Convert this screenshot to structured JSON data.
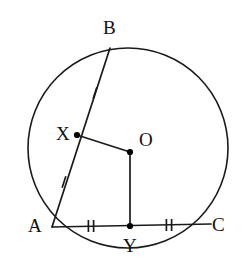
{
  "figure": {
    "type": "circle-geometry-diagram",
    "canvas": {
      "width": 247,
      "height": 263
    },
    "background_color": "#ffffff",
    "stroke_color": "#1a1a1a",
    "point_fill_color": "#000000"
  },
  "circle": {
    "label": "circle",
    "center_x": 128,
    "center_y": 148,
    "radius": 100,
    "stroke_width": 1.6
  },
  "points": [
    {
      "id": "B",
      "label": "B",
      "x": 110,
      "y": 48,
      "on_circle": true,
      "dot": false,
      "label_x": 103,
      "label_y": 18
    },
    {
      "id": "X",
      "label": "X",
      "x": 77,
      "y": 135,
      "on_circle": false,
      "dot": true,
      "label_x": 56,
      "label_y": 124
    },
    {
      "id": "O",
      "label": "O",
      "x": 130,
      "y": 152,
      "on_circle": false,
      "dot": true,
      "label_x": 139,
      "label_y": 130
    },
    {
      "id": "A",
      "label": "A",
      "x": 52,
      "y": 227,
      "on_circle": true,
      "dot": false,
      "label_x": 28,
      "label_y": 216
    },
    {
      "id": "Y",
      "label": "Y",
      "x": 130,
      "y": 226,
      "on_circle": false,
      "dot": true,
      "label_x": 123,
      "label_y": 236
    },
    {
      "id": "C",
      "label": "C",
      "x": 211,
      "y": 224,
      "on_circle": true,
      "dot": false,
      "label_x": 212,
      "label_y": 215
    }
  ],
  "segments": [
    {
      "id": "AB",
      "from": "A",
      "to": "B",
      "x1": 52,
      "y1": 227,
      "x2": 110,
      "y2": 48,
      "description": "chord-a-b"
    },
    {
      "id": "AC",
      "from": "A",
      "to": "C",
      "x1": 52,
      "y1": 227,
      "x2": 211,
      "y2": 224,
      "description": "chord-a-c"
    },
    {
      "id": "OX",
      "from": "O",
      "to": "X",
      "x1": 130,
      "y1": 152,
      "x2": 77,
      "y2": 135,
      "description": "radius-segment-o-x"
    },
    {
      "id": "OY",
      "from": "O",
      "to": "Y",
      "x1": 130,
      "y1": 152,
      "x2": 130,
      "y2": 226,
      "description": "radius-segment-o-y"
    }
  ],
  "tick_marks": [
    {
      "id": "tick-XB",
      "on_segment": "AB",
      "count": 1,
      "x": 95,
      "y": 93,
      "angle": 18,
      "note": "single tick on X-to-B half of chord AB"
    },
    {
      "id": "tick-AX",
      "on_segment": "AB",
      "count": 1,
      "x": 64,
      "y": 182,
      "angle": 18,
      "note": "single tick on A-to-X half of chord AB"
    },
    {
      "id": "tick-AY",
      "on_segment": "AC",
      "count": 2,
      "x": 91,
      "y": 226,
      "angle": 0,
      "note": "double tick on A-to-Y half of chord AC"
    },
    {
      "id": "tick-YC",
      "on_segment": "AC",
      "count": 2,
      "x": 169,
      "y": 225,
      "angle": 0,
      "note": "double tick on Y-to-C half of chord AC"
    }
  ]
}
